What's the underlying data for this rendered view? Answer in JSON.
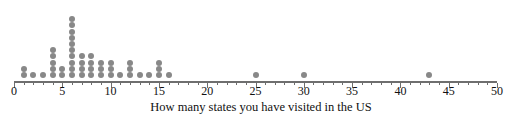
{
  "chart_data": {
    "type": "scatter",
    "plot_style": "dot-plot",
    "title": "",
    "subtitle": "",
    "xlabel": "How many states you have visited in the US",
    "ylabel": "",
    "xlim": [
      0,
      50
    ],
    "ylim": [
      0,
      11
    ],
    "grid": false,
    "legend": null,
    "tick_labels": [
      "0",
      "5",
      "10",
      "15",
      "20",
      "25",
      "30",
      "35",
      "40",
      "45",
      "50"
    ],
    "ticks": [
      0,
      5,
      10,
      15,
      20,
      25,
      30,
      35,
      40,
      45,
      50
    ],
    "minor_tick_step": 1,
    "x": [
      1,
      2,
      3,
      4,
      5,
      6,
      7,
      8,
      9,
      10,
      11,
      12,
      13,
      14,
      15,
      16,
      25,
      30,
      43
    ],
    "counts": [
      2,
      1,
      1,
      5,
      2,
      10,
      4,
      4,
      3,
      3,
      1,
      3,
      1,
      1,
      3,
      1,
      1,
      1,
      1
    ],
    "total_observations": 48,
    "annotations": []
  },
  "style": {
    "dot_color": "#888888",
    "axis_color": "#6e6e6e",
    "text_color": "#111111",
    "background": "#ffffff",
    "dot_diameter_px": 6,
    "dot_spacing_px": 6.2
  },
  "geometry": {
    "axis_left_px": 14,
    "axis_right_px": 497,
    "axis_y_px": 81,
    "baseline_dot_y_px": 75,
    "tick_height_px": 5,
    "tick_label_y_px": 85,
    "axis_title_y_px": 100,
    "axis_title_center_x_px": 261
  }
}
